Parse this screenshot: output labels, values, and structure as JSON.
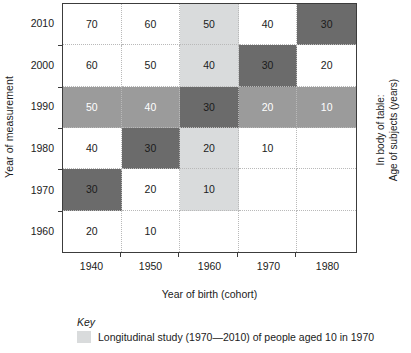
{
  "axes": {
    "y_title": "Year of measurement",
    "x_title": "Year of birth (cohort)",
    "y_ticks": [
      "2010",
      "2000",
      "1990",
      "1980",
      "1970",
      "1960"
    ],
    "x_ticks": [
      "1940",
      "1950",
      "1960",
      "1970",
      "1980"
    ]
  },
  "right_note": {
    "line1": "In body of table:",
    "line2": "Age of subjects (years)"
  },
  "key": {
    "title": "Key",
    "label": "Longitudinal study (1970—2010) of people aged 10 in 1970",
    "swatch_color": "#d9dbdc"
  },
  "colors": {
    "none": "#ffffff",
    "light": "#d9dbdc",
    "mid": "#9b9b9b",
    "dark": "#6b6b6b",
    "frame": "#3c3c3c",
    "gridline": "#b9b9b9"
  },
  "chart_data": {
    "type": "heatmap",
    "title": "",
    "xlabel": "Year of birth (cohort)",
    "ylabel": "Year of measurement",
    "value_meaning": "Age of subjects (years)",
    "x": [
      "1940",
      "1950",
      "1960",
      "1970",
      "1980"
    ],
    "y": [
      "2010",
      "2000",
      "1990",
      "1980",
      "1970",
      "1960"
    ],
    "rows": [
      {
        "y": "2010",
        "cells": [
          {
            "x": "1940",
            "value": "70",
            "shade": "none"
          },
          {
            "x": "1950",
            "value": "60",
            "shade": "none"
          },
          {
            "x": "1960",
            "value": "50",
            "shade": "light"
          },
          {
            "x": "1970",
            "value": "40",
            "shade": "none"
          },
          {
            "x": "1980",
            "value": "30",
            "shade": "dark"
          }
        ]
      },
      {
        "y": "2000",
        "cells": [
          {
            "x": "1940",
            "value": "60",
            "shade": "none"
          },
          {
            "x": "1950",
            "value": "50",
            "shade": "none"
          },
          {
            "x": "1960",
            "value": "40",
            "shade": "light"
          },
          {
            "x": "1970",
            "value": "30",
            "shade": "dark"
          },
          {
            "x": "1980",
            "value": "20",
            "shade": "none"
          }
        ]
      },
      {
        "y": "1990",
        "cells": [
          {
            "x": "1940",
            "value": "50",
            "shade": "mid"
          },
          {
            "x": "1950",
            "value": "40",
            "shade": "mid"
          },
          {
            "x": "1960",
            "value": "30",
            "shade": "dark"
          },
          {
            "x": "1970",
            "value": "20",
            "shade": "mid"
          },
          {
            "x": "1980",
            "value": "10",
            "shade": "mid"
          }
        ]
      },
      {
        "y": "1980",
        "cells": [
          {
            "x": "1940",
            "value": "40",
            "shade": "none"
          },
          {
            "x": "1950",
            "value": "30",
            "shade": "dark"
          },
          {
            "x": "1960",
            "value": "20",
            "shade": "light"
          },
          {
            "x": "1970",
            "value": "10",
            "shade": "none"
          },
          {
            "x": "1980",
            "value": "",
            "shade": "none"
          }
        ]
      },
      {
        "y": "1970",
        "cells": [
          {
            "x": "1940",
            "value": "30",
            "shade": "dark"
          },
          {
            "x": "1950",
            "value": "20",
            "shade": "none"
          },
          {
            "x": "1960",
            "value": "10",
            "shade": "light"
          },
          {
            "x": "1970",
            "value": "",
            "shade": "none"
          },
          {
            "x": "1980",
            "value": "",
            "shade": "none"
          }
        ]
      },
      {
        "y": "1960",
        "cells": [
          {
            "x": "1940",
            "value": "20",
            "shade": "none"
          },
          {
            "x": "1950",
            "value": "10",
            "shade": "none"
          },
          {
            "x": "1960",
            "value": "",
            "shade": "none"
          },
          {
            "x": "1970",
            "value": "",
            "shade": "none"
          },
          {
            "x": "1980",
            "value": "",
            "shade": "none"
          }
        ]
      }
    ],
    "legend": [
      {
        "shade": "light",
        "label": "Longitudinal study (1970—2010) of people aged 10 in 1970"
      }
    ],
    "legend_position": "below-axis-left"
  }
}
